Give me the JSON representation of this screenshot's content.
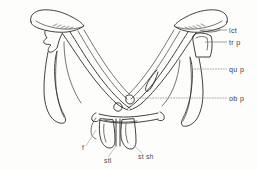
{
  "figure": {
    "type": "anatomical-line-drawing",
    "background_color": "#fdfdfc",
    "line_color": "#2b2b2b",
    "leader_color": "#8a8a8a",
    "label_color": "#3d3d3d"
  },
  "labels": {
    "right": [
      {
        "id": "lct",
        "text": "lct",
        "leader": "solid",
        "x": 229,
        "y": 33
      },
      {
        "id": "tr_p",
        "text": "tr p",
        "leader": "solid",
        "x": 229,
        "y": 45
      },
      {
        "id": "qu_p",
        "text": "qu p",
        "leader": "dotted",
        "x": 229,
        "y": 72
      },
      {
        "id": "ob_p",
        "text": "ob p",
        "leader": "dotted",
        "x": 229,
        "y": 101
      }
    ],
    "bottom": [
      {
        "id": "f",
        "text": "f",
        "leader": "thin",
        "x": 82,
        "y": 150
      },
      {
        "id": "stl",
        "text": "stl",
        "leader": "thin",
        "x": 104,
        "y": 163
      },
      {
        "id": "st_sh",
        "text": "st sh",
        "leader": "thin",
        "x": 138,
        "y": 159
      }
    ]
  }
}
